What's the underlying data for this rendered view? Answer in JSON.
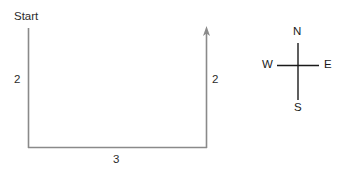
{
  "diagram": {
    "type": "path-with-compass",
    "background_color": "#ffffff",
    "path_color": "#8a8a8a",
    "compass_color": "#1a1a1a",
    "text_color": "#2b2b2b",
    "start_label": "Start",
    "segments": [
      {
        "name": "left-vertical",
        "label": "2",
        "direction": "south",
        "length": 2
      },
      {
        "name": "bottom-horizontal",
        "label": "3",
        "direction": "east",
        "length": 3
      },
      {
        "name": "right-vertical",
        "label": "2",
        "direction": "north",
        "length": 2,
        "arrow": true
      }
    ],
    "compass": {
      "north": "N",
      "east": "E",
      "south": "S",
      "west": "W"
    }
  }
}
